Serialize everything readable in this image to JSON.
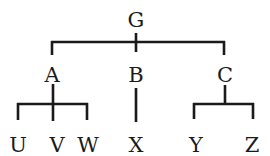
{
  "diagram": {
    "type": "tree",
    "root": {
      "label": "G",
      "children": [
        {
          "label": "A",
          "children": [
            {
              "label": "U"
            },
            {
              "label": "V"
            },
            {
              "label": "W"
            }
          ]
        },
        {
          "label": "B",
          "children": [
            {
              "label": "X"
            }
          ]
        },
        {
          "label": "C",
          "children": [
            {
              "label": "Y"
            },
            {
              "label": "Z"
            }
          ]
        }
      ]
    },
    "colors": {
      "line": "#1a1a1a",
      "text": "#1a1a1a",
      "background": "#ffffff"
    }
  },
  "labels": {
    "g": "G",
    "a": "A",
    "b": "B",
    "c": "C",
    "u": "U",
    "v": "V",
    "w": "W",
    "x": "X",
    "y": "Y",
    "z": "Z"
  }
}
